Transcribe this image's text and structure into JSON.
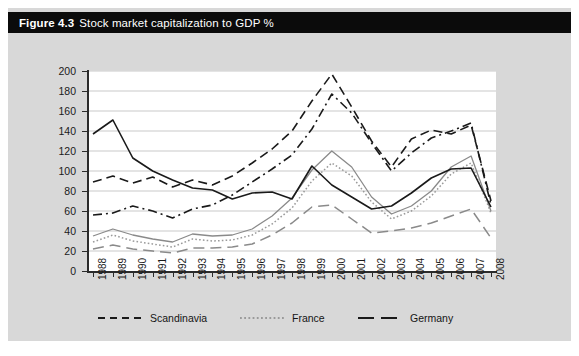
{
  "figure": {
    "number": "Figure 4.3",
    "title": "Stock market capitalization to GDP %"
  },
  "colors": {
    "panel_background": "#d8d8d8",
    "title_bar": "#0b0b0b",
    "title_text": "#ffffff",
    "plot_background": "#ffffff",
    "gridline": "#c9c9c9",
    "axis": "#2b2b2b",
    "series_dark": "#1a1a1a",
    "series_grey": "#8a8a8a"
  },
  "axes": {
    "y_ticks": [
      "0",
      "20",
      "40",
      "60",
      "80",
      "100",
      "120",
      "140",
      "160",
      "180",
      "200"
    ],
    "y_min": 0,
    "y_max": 200,
    "y_step": 20,
    "x_ticks": [
      "1988",
      "1989",
      "1990",
      "1991",
      "1992",
      "1993",
      "1994",
      "1995",
      "1996",
      "1997",
      "1998",
      "1999",
      "2000",
      "2001",
      "2002",
      "2003",
      "2004",
      "2005",
      "2006",
      "2007",
      "2008"
    ]
  },
  "legend": {
    "position": "bottom",
    "items": [
      {
        "label": "Scandinavia",
        "style": "dashed"
      },
      {
        "label": "France",
        "style": "dotted"
      },
      {
        "label": "Germany",
        "style": "solid"
      }
    ]
  },
  "chart_data": {
    "type": "line",
    "title": "Stock market capitalization to GDP %",
    "xlabel": "",
    "ylabel": "",
    "ylim": [
      0,
      200
    ],
    "grid": true,
    "legend_position": "bottom",
    "x": [
      "1988",
      "1989",
      "1990",
      "1991",
      "1992",
      "1993",
      "1994",
      "1995",
      "1996",
      "1997",
      "1998",
      "1999",
      "2000",
      "2001",
      "2002",
      "2003",
      "2004",
      "2005",
      "2006",
      "2007",
      "2008"
    ],
    "series": [
      {
        "name": "Scandinavia",
        "style": "dashed",
        "color": "#1a1a1a",
        "values": [
          89,
          95,
          88,
          94,
          84,
          91,
          86,
          95,
          108,
          122,
          140,
          170,
          197,
          164,
          130,
          104,
          132,
          141,
          137,
          146,
          70
        ]
      },
      {
        "name": "Scandinavia (alt)",
        "style": "dash-dot",
        "color": "#1a1a1a",
        "values": [
          56,
          58,
          65,
          60,
          53,
          62,
          66,
          76,
          89,
          102,
          116,
          142,
          177,
          158,
          128,
          100,
          118,
          133,
          140,
          148,
          66
        ]
      },
      {
        "name": "France",
        "style": "dotted",
        "color": "#9a9a9a",
        "values": [
          29,
          36,
          30,
          27,
          24,
          32,
          30,
          31,
          36,
          47,
          63,
          90,
          108,
          95,
          69,
          52,
          60,
          75,
          97,
          108,
          58
        ]
      },
      {
        "name": "France (upper)",
        "style": "solid-grey",
        "color": "#8a8a8a",
        "values": [
          35,
          42,
          36,
          32,
          29,
          37,
          35,
          36,
          42,
          55,
          73,
          101,
          120,
          104,
          74,
          57,
          65,
          80,
          104,
          115,
          60
        ]
      },
      {
        "name": "Germany (long dash)",
        "style": "long-dash",
        "color": "#8a8a8a",
        "values": [
          22,
          26,
          22,
          20,
          18,
          23,
          23,
          24,
          27,
          36,
          48,
          64,
          66,
          52,
          38,
          40,
          43,
          48,
          55,
          62,
          33
        ]
      },
      {
        "name": "Germany",
        "style": "solid",
        "color": "#1a1a1a",
        "values": [
          137,
          151,
          113,
          100,
          91,
          83,
          81,
          72,
          78,
          79,
          72,
          105,
          86,
          74,
          62,
          65,
          78,
          93,
          102,
          103,
          64
        ]
      }
    ]
  }
}
